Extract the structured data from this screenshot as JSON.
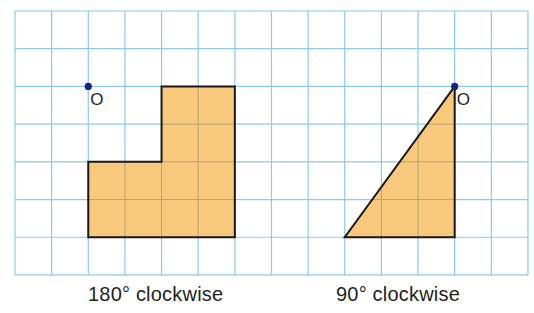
{
  "grid": {
    "left": 15,
    "top": 11,
    "cols": 14,
    "rows": 7,
    "cell_w": 36.64,
    "cell_h": 37.71,
    "line_color": "#8ec8ea"
  },
  "colors": {
    "fill": "#f8c87c",
    "outline": "#1a1a1a",
    "point": "#1a237e",
    "text": "#231f20"
  },
  "figures": [
    {
      "name": "l-shape",
      "caption": "180° clockwise",
      "caption_x": 88,
      "center_label": "O",
      "center_cell": [
        2,
        2
      ],
      "polygon_cells": [
        [
          4,
          2
        ],
        [
          6,
          2
        ],
        [
          6,
          6
        ],
        [
          2,
          6
        ],
        [
          2,
          4
        ],
        [
          4,
          4
        ]
      ]
    },
    {
      "name": "right-triangle",
      "caption": "90° clockwise",
      "caption_x": 336,
      "center_label": "O",
      "center_cell": [
        12,
        2
      ],
      "polygon_cells": [
        [
          12,
          2
        ],
        [
          12,
          6
        ],
        [
          9,
          6
        ]
      ]
    }
  ]
}
